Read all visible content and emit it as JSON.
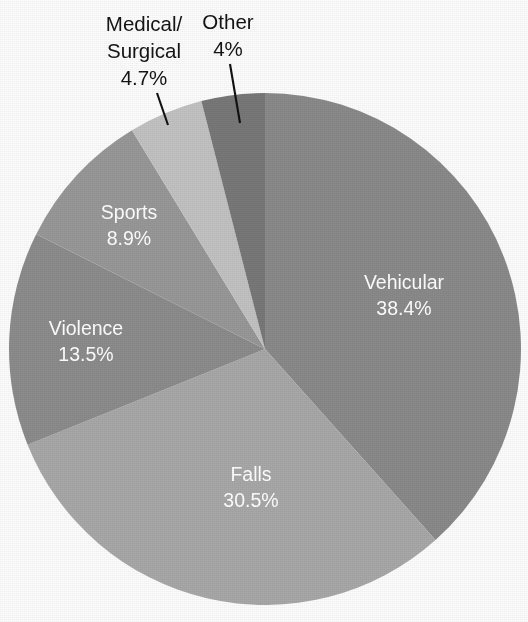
{
  "chart_data": {
    "type": "pie",
    "title": "",
    "subtitle": "",
    "xlabel": "",
    "ylabel": "",
    "legend_position": "none",
    "grid": false,
    "start_angle_deg": 0,
    "direction": "clockwise",
    "categories": [
      "Vehicular",
      "Falls",
      "Violence",
      "Sports",
      "Medical/Surgical",
      "Other"
    ],
    "values": [
      38.4,
      30.5,
      13.5,
      8.9,
      4.7,
      4.0
    ],
    "value_labels": [
      "38.4%",
      "30.5%",
      "13.5%",
      "8.9%",
      "4.7%",
      "4%"
    ],
    "colors": [
      "#8a8a8a",
      "#a8a8a8",
      "#8c8c8c",
      "#989898",
      "#c2c2c2",
      "#787878"
    ],
    "slices": [
      {
        "name": "Vehicular",
        "value": 38.4,
        "value_label": "38.4%",
        "color": "#8a8a8a",
        "label_placement": "inside",
        "label_color": "#ffffff",
        "label_x": 404,
        "label_y": 284,
        "label_line2_y": 310
      },
      {
        "name": "Falls",
        "value": 30.5,
        "value_label": "30.5%",
        "color": "#a8a8a8",
        "label_placement": "inside",
        "label_color": "#ffffff",
        "label_x": 251,
        "label_y": 476,
        "label_line2_y": 502
      },
      {
        "name": "Violence",
        "value": 13.5,
        "value_label": "13.5%",
        "color": "#8c8c8c",
        "label_placement": "inside",
        "label_color": "#ffffff",
        "label_x": 86,
        "label_y": 330,
        "label_line2_y": 356
      },
      {
        "name": "Sports",
        "value": 8.9,
        "value_label": "8.9%",
        "color": "#989898",
        "label_placement": "inside",
        "label_color": "#ffffff",
        "label_x": 129,
        "label_y": 214,
        "label_line2_y": 240
      },
      {
        "name": "Medical/Surgical",
        "value": 4.7,
        "value_label": "4.7%",
        "color": "#c2c2c2",
        "label_placement": "outside",
        "label_color": "#141414",
        "label_line_1": "Medical/",
        "label_line_2": "Surgical",
        "label_x": 144,
        "label_y": 26,
        "label_line2_y": 53,
        "label_line3_y": 80,
        "leader_x1": 157,
        "leader_y1": 93,
        "leader_x2": 168,
        "leader_y2": 125
      },
      {
        "name": "Other",
        "value": 4.0,
        "value_label": "4%",
        "color": "#787878",
        "label_placement": "outside",
        "label_color": "#141414",
        "label_x": 228,
        "label_y": 24,
        "label_line2_y": 51,
        "leader_x1": 230,
        "leader_y1": 64,
        "leader_x2": 240,
        "leader_y2": 123
      }
    ],
    "geometry": {
      "center_x": 265,
      "center_y": 349,
      "radius": 256
    }
  }
}
